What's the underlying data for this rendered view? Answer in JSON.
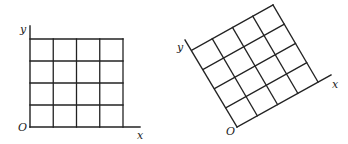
{
  "figures": [
    {
      "name": "original-grid",
      "axis_labels": {
        "x": "x",
        "y": "y",
        "origin": "O"
      },
      "grid": {
        "cols": 4,
        "rows": 4
      },
      "rotation_deg": 0,
      "geometry": {
        "origin": [
          30,
          127
        ],
        "u": [
          23.25,
          0
        ],
        "v": [
          0,
          -22
        ],
        "x_axis_end": [
          140,
          127
        ],
        "y_axis_end": [
          30,
          26
        ]
      },
      "label_pos": {
        "x": [
          137,
          139
        ],
        "y": [
          20,
          33
        ],
        "origin": [
          18,
          131
        ]
      }
    },
    {
      "name": "rotated-grid",
      "axis_labels": {
        "x": "x",
        "y": "y",
        "origin": "O"
      },
      "grid": {
        "cols": 4,
        "rows": 4
      },
      "rotation_deg": -29,
      "geometry": {
        "origin": [
          237,
          127
        ],
        "u": [
          20.25,
          -11.25
        ],
        "v": [
          -11.25,
          -19.25
        ],
        "x_axis_end": [
          331,
          75
        ],
        "y_axis_end": [
          185,
          40
        ]
      },
      "label_pos": {
        "x": [
          332,
          88
        ],
        "y": [
          177,
          51
        ],
        "origin": [
          226,
          135
        ]
      }
    }
  ],
  "colors": {
    "line": "#222222",
    "background": "#ffffff"
  }
}
